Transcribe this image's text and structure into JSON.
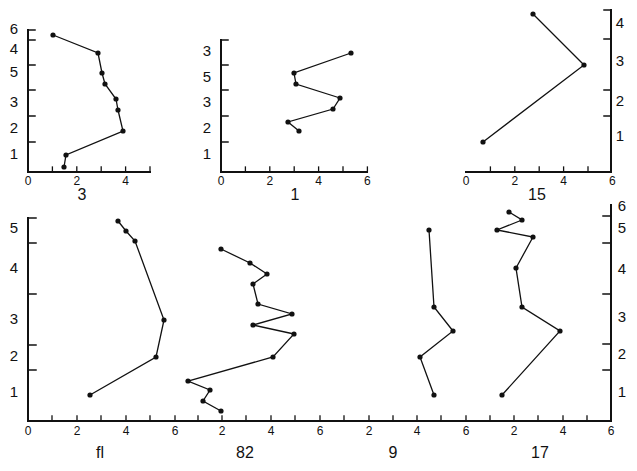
{
  "figure": {
    "background": "#ffffff",
    "ink": "#111111"
  },
  "chart_data": [
    {
      "type": "line",
      "title": "3",
      "panel_label": "3",
      "xlim": [
        0,
        5
      ],
      "x_ticks": [
        "0",
        "2",
        "4"
      ],
      "y_tick_labels": [
        "6",
        "4",
        "5",
        "3",
        "2",
        "1"
      ],
      "points": [
        [
          1.0,
          5.7
        ],
        [
          2.9,
          5.1
        ],
        [
          3.1,
          4.4
        ],
        [
          3.2,
          4.0
        ],
        [
          3.6,
          3.5
        ],
        [
          3.7,
          3.1
        ],
        [
          3.9,
          2.4
        ],
        [
          1.6,
          1.5
        ],
        [
          1.5,
          1.0
        ]
      ],
      "px": {
        "axis_x": 28,
        "axis_top": 30,
        "axis_bottom": 172,
        "x_end": 150,
        "x_zero": 28,
        "unit": 24.4,
        "ticks_y": [
          40,
          65,
          90,
          116,
          142
        ],
        "ytick_side": "right",
        "ylabels_y": [
          30,
          50,
          73,
          103,
          129,
          155
        ],
        "ylabels_x": 14,
        "pts": [
          [
            53,
            35
          ],
          [
            98,
            53
          ],
          [
            102,
            73
          ],
          [
            105,
            84
          ],
          [
            116,
            99
          ],
          [
            118,
            110
          ],
          [
            123,
            131
          ],
          [
            66,
            155
          ],
          [
            64,
            167
          ]
        ],
        "title_xy": [
          82,
          196
        ]
      }
    },
    {
      "type": "line",
      "title": "1",
      "panel_label": "1",
      "xlim": [
        0,
        6
      ],
      "x_ticks": [
        "0",
        "2",
        "4",
        "6"
      ],
      "y_tick_labels": [
        "3",
        "5",
        "3",
        "2",
        "1"
      ],
      "points": [
        [
          5.3,
          4.6
        ],
        [
          3.0,
          3.9
        ],
        [
          3.1,
          3.5
        ],
        [
          4.9,
          2.9
        ],
        [
          4.6,
          2.5
        ],
        [
          2.7,
          2.0
        ],
        [
          3.2,
          1.6
        ]
      ],
      "px": {
        "axis_x": 221,
        "axis_top": 40,
        "axis_bottom": 172,
        "x_end": 367,
        "x_zero": 221,
        "unit": 24.4,
        "ticks_y": [
          65,
          90,
          116,
          142
        ],
        "ytick_side": "right",
        "ylabels_y": [
          52,
          78,
          103,
          129,
          155
        ],
        "ylabels_x": 207,
        "pts": [
          [
            351,
            53
          ],
          [
            294,
            73
          ],
          [
            296,
            84
          ],
          [
            340,
            98
          ],
          [
            333,
            109
          ],
          [
            288,
            122
          ],
          [
            299,
            131
          ]
        ],
        "title_xy": [
          295,
          196
        ]
      }
    },
    {
      "type": "line",
      "title": "15",
      "panel_label": "15",
      "xlim": [
        0,
        6
      ],
      "x_ticks": [
        "0",
        "2",
        "4",
        "6"
      ],
      "y_tick_labels": [
        "4",
        "3",
        "2",
        "1"
      ],
      "points": [
        [
          2.8,
          4.5
        ],
        [
          4.9,
          3.0
        ],
        [
          0.7,
          1.0
        ]
      ],
      "px": {
        "axis_x": 611,
        "axis_top": 10,
        "axis_bottom": 172,
        "x_end": 611,
        "x_start": 466,
        "x_zero": 466,
        "unit": 24.4,
        "ticks_y": [
          39,
          90,
          116
        ],
        "ytick_side": "left",
        "ylabels_y": [
          24,
          62,
          102,
          137
        ],
        "ylabels_x": 620,
        "pts": [
          [
            533,
            14
          ],
          [
            584,
            65
          ],
          [
            483,
            142
          ]
        ],
        "title_xy": [
          537,
          196
        ]
      }
    },
    {
      "type": "line",
      "title": "fl",
      "panel_label": "fl",
      "xlim": [
        0,
        6
      ],
      "x_ticks": [
        "0",
        "2",
        "4",
        "6"
      ],
      "y_tick_labels": [
        "5",
        "4",
        "3",
        "2",
        "1"
      ],
      "points": [
        [
          3.7,
          5.4
        ],
        [
          4.0,
          5.2
        ],
        [
          4.4,
          5.0
        ],
        [
          5.6,
          3.3
        ],
        [
          5.3,
          2.5
        ],
        [
          2.5,
          1.0
        ]
      ],
      "px": {
        "pts": [
          [
            118,
            221
          ],
          [
            126,
            231
          ],
          [
            135,
            241
          ],
          [
            164,
            320
          ],
          [
            156,
            357
          ],
          [
            90,
            395
          ]
        ],
        "title_xy": [
          100,
          454
        ]
      }
    },
    {
      "type": "line",
      "title": "82",
      "panel_label": "82",
      "xlim": [
        0,
        6
      ],
      "x_ticks": [
        "2",
        "4",
        "6"
      ],
      "points": [
        [
          2.0,
          4.9
        ],
        [
          3.2,
          4.5
        ],
        [
          3.9,
          4.3
        ],
        [
          3.3,
          4.1
        ],
        [
          3.5,
          3.7
        ],
        [
          4.9,
          3.5
        ],
        [
          3.3,
          3.2
        ],
        [
          5.0,
          3.0
        ],
        [
          4.1,
          2.5
        ],
        [
          0.6,
          2.0
        ],
        [
          1.5,
          1.8
        ],
        [
          1.2,
          1.6
        ],
        [
          2.0,
          1.4
        ]
      ],
      "px": {
        "pts": [
          [
            221,
            249
          ],
          [
            250,
            263
          ],
          [
            267,
            274
          ],
          [
            253,
            284
          ],
          [
            258,
            304
          ],
          [
            292,
            314
          ],
          [
            253,
            325
          ],
          [
            294,
            334
          ],
          [
            273,
            357
          ],
          [
            188,
            381
          ],
          [
            210,
            390
          ],
          [
            203,
            401
          ],
          [
            221,
            411
          ]
        ],
        "title_xy": [
          245,
          454
        ]
      }
    },
    {
      "type": "line",
      "title": "9",
      "panel_label": "9",
      "xlim": [
        0,
        6
      ],
      "x_ticks": [
        "2",
        "4",
        "6"
      ],
      "points": [
        [
          4.5,
          5.4
        ],
        [
          4.7,
          3.5
        ],
        [
          5.5,
          3.0
        ],
        [
          4.1,
          2.3
        ],
        [
          4.7,
          1.0
        ]
      ],
      "px": {
        "pts": [
          [
            429,
            230
          ],
          [
            434,
            307
          ],
          [
            453,
            331
          ],
          [
            420,
            357
          ],
          [
            434,
            395
          ]
        ],
        "title_xy": [
          393,
          454
        ]
      }
    },
    {
      "type": "line",
      "title": "17",
      "panel_label": "17",
      "xlim": [
        0,
        6
      ],
      "x_ticks": [
        "2",
        "4",
        "6"
      ],
      "points": [
        [
          1.9,
          5.8
        ],
        [
          2.4,
          5.6
        ],
        [
          1.3,
          5.4
        ],
        [
          2.8,
          5.2
        ],
        [
          2.1,
          4.1
        ],
        [
          2.3,
          3.5
        ],
        [
          3.9,
          3.0
        ],
        [
          1.5,
          1.0
        ]
      ],
      "px": {
        "pts": [
          [
            509,
            212
          ],
          [
            522,
            220
          ],
          [
            497,
            230
          ],
          [
            533,
            237
          ],
          [
            516,
            268
          ],
          [
            522,
            307
          ],
          [
            560,
            331
          ],
          [
            502,
            395
          ]
        ],
        "title_xy": [
          540,
          454
        ]
      }
    }
  ],
  "bottom_axis": {
    "baseline_y": 421,
    "x_start": 28,
    "x_end": 611,
    "tick_labels": [
      "0",
      "2",
      "4",
      "6",
      "2",
      "4",
      "6",
      "2",
      "4",
      "6",
      "2",
      "4",
      "6"
    ],
    "tick_label_x": [
      28,
      77,
      126,
      175,
      222,
      271,
      320,
      369,
      417,
      466,
      514,
      563,
      611
    ],
    "minor_tick_x": [
      52,
      101,
      150,
      198,
      246,
      295,
      344,
      393,
      441,
      490,
      538,
      587
    ],
    "left_axis": {
      "x": 28,
      "top": 218,
      "ticks_y": [
        243,
        294,
        345,
        370
      ],
      "labels": [
        "5",
        "4",
        "3",
        "2",
        "1"
      ],
      "labels_y": [
        229,
        269,
        320,
        357,
        393
      ]
    },
    "right_axis": {
      "x": 611,
      "top": 205,
      "ticks_y": [
        216,
        243,
        294,
        344,
        370
      ],
      "labels": [
        "6",
        "5",
        "4",
        "3",
        "2",
        "1"
      ],
      "labels_y": [
        207,
        229,
        270,
        318,
        355,
        393
      ]
    }
  }
}
